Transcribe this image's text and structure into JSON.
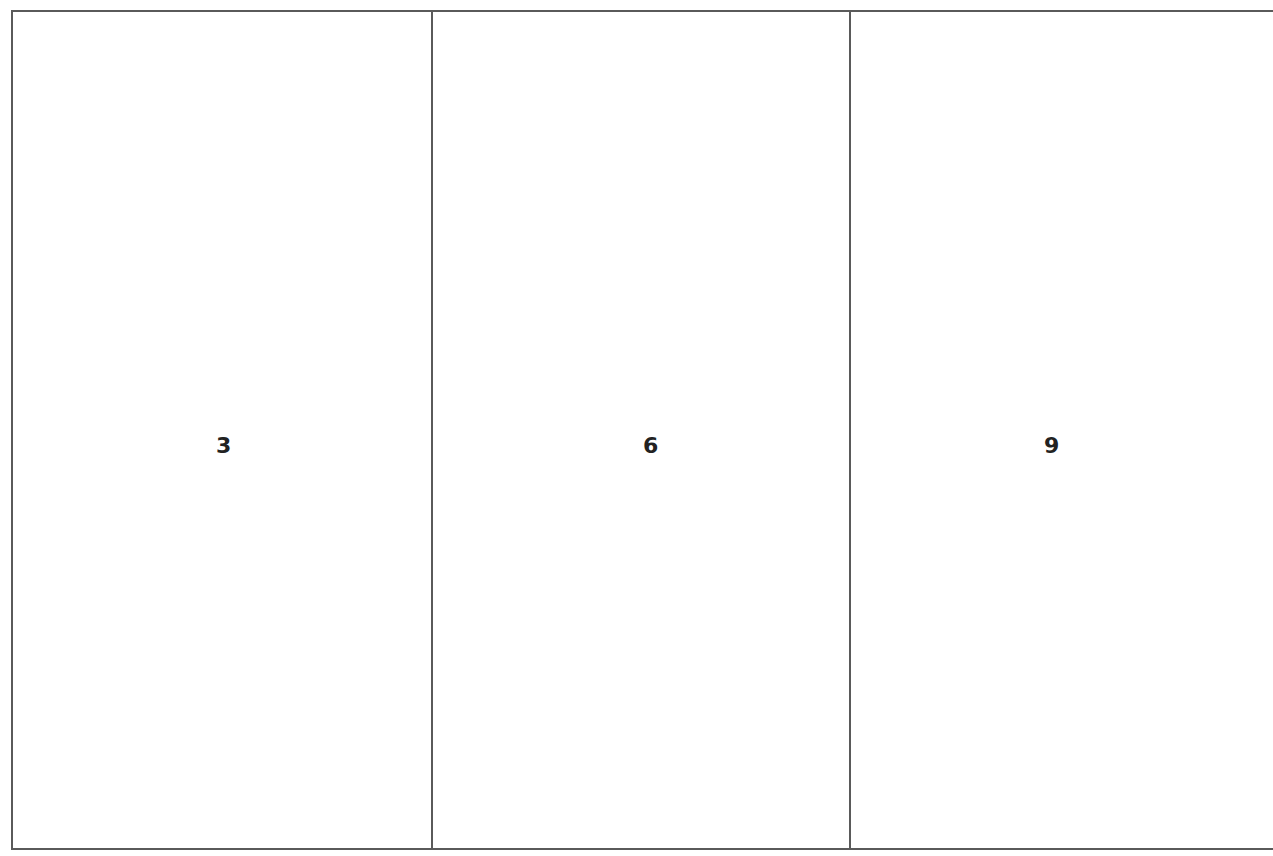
{
  "diagram": {
    "type": "three-panel-layout",
    "border_color": "#5a5a5a",
    "panels": [
      {
        "label": "3"
      },
      {
        "label": "6"
      },
      {
        "label": "9"
      }
    ]
  }
}
